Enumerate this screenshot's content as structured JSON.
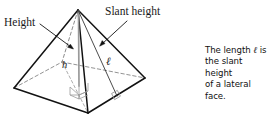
{
  "figure": {
    "background_color": "#ffffff",
    "line_color": "#1a1a1a",
    "hidden_edge_color": "#6b6b6b",
    "height_segment_color": "#8c8c8c"
  },
  "labels": {
    "height": "Height",
    "slant_height": "Slant height",
    "h_symbol": "h",
    "ell_symbol": "ℓ"
  },
  "caption": {
    "line1_prefix": "The length ",
    "line1_symbol": "ℓ",
    "line1_suffix": " is",
    "line2": "the slant height",
    "line3": "of a lateral face."
  },
  "geometry": {
    "apex": [
      78,
      10
    ],
    "base_left": [
      14,
      88
    ],
    "base_front": [
      88,
      113
    ],
    "base_right": [
      145,
      78
    ],
    "base_back_hidden": [
      62,
      62
    ],
    "base_center": [
      79,
      85
    ],
    "slant_foot": [
      117,
      96
    ],
    "height_foot": [
      79,
      85
    ]
  }
}
